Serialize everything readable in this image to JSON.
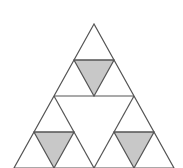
{
  "diagram": {
    "type": "sierpinski-triangle",
    "level": 2,
    "colors": {
      "background": "#ffffff",
      "stroke": "#555555",
      "filled": "#c8c8c8"
    },
    "outer_triangle": {
      "apex": [
        94,
        24
      ],
      "base_left": [
        14,
        168
      ],
      "base_right": [
        174,
        168
      ]
    },
    "lines": [
      {
        "x1": 54,
        "y1": 96,
        "x2": 134,
        "y2": 96
      },
      {
        "x1": 74,
        "y1": 60,
        "x2": 114,
        "y2": 60
      },
      {
        "x1": 34,
        "y1": 132,
        "x2": 74,
        "y2": 132
      },
      {
        "x1": 114,
        "y1": 132,
        "x2": 154,
        "y2": 132
      },
      {
        "x1": 54,
        "y1": 96,
        "x2": 94,
        "y2": 168
      },
      {
        "x1": 134,
        "y1": 96,
        "x2": 94,
        "y2": 168
      }
    ],
    "filled_triangles": [
      {
        "points": "74,60 114,60 94,96"
      },
      {
        "points": "34,132 74,132 54,168"
      },
      {
        "points": "114,132 154,132 134,168"
      }
    ]
  }
}
